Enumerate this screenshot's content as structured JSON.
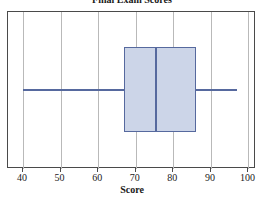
{
  "chart_data": {
    "type": "box",
    "title": "Final Exam Scores",
    "xlabel": "Score",
    "ylabel": "",
    "xlim": [
      36,
      102
    ],
    "xticks": [
      40,
      50,
      60,
      70,
      80,
      90,
      100
    ],
    "xtick_labels": [
      "40",
      "50",
      "60",
      "70",
      "80",
      "90",
      "100"
    ],
    "grid": true,
    "grid_axis": "x",
    "legend": null,
    "orientation": "horizontal",
    "boxes": [
      {
        "name": "Score",
        "min": 40,
        "q1": 67,
        "median": 75.5,
        "q3": 86,
        "max": 97,
        "outliers": []
      }
    ],
    "colors": {
      "box_fill": "#ccd5e8",
      "box_edge": "#56699e",
      "whisker": "#56699e",
      "median": "#56699e",
      "gridline": "#b9b9b9",
      "frame": "#4a4a4a",
      "text": "#1a1a1a"
    }
  }
}
